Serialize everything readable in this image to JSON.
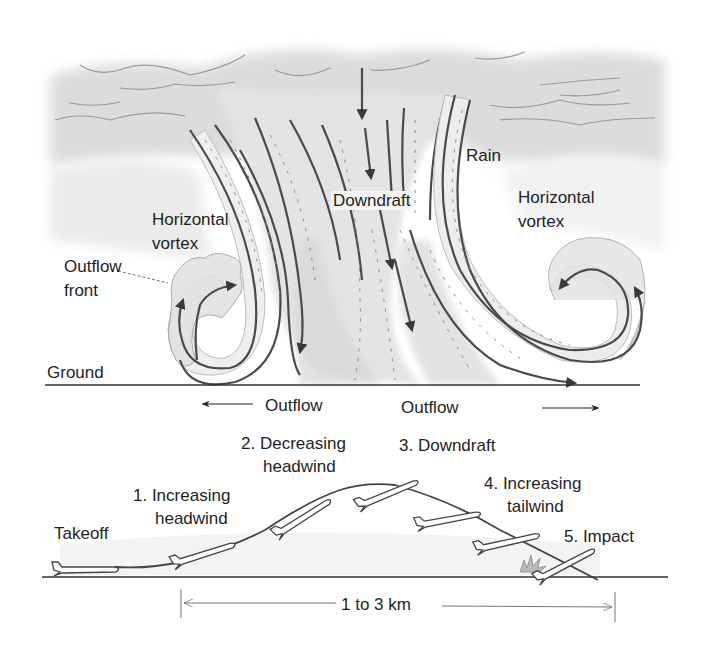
{
  "diagram": {
    "type": "microburst-wind-shear",
    "storm": {
      "labels": {
        "rain": "Rain",
        "downdraft": "Downdraft",
        "left_vortex": [
          "Horizontal",
          "vortex"
        ],
        "right_vortex": [
          "Horizontal",
          "vortex"
        ],
        "outflow_front": [
          "Outflow",
          "front"
        ],
        "ground": "Ground",
        "outflow_left": "Outflow",
        "outflow_right": "Outflow"
      }
    },
    "flight_path": {
      "stages": [
        {
          "id": 0,
          "label": [
            "Takeoff"
          ]
        },
        {
          "id": 1,
          "label": [
            "1. Increasing",
            "headwind"
          ]
        },
        {
          "id": 2,
          "label": [
            "2. Decreasing",
            "headwind"
          ]
        },
        {
          "id": 3,
          "label": [
            "3. Downdraft"
          ]
        },
        {
          "id": 4,
          "label": [
            "4. Increasing",
            "tailwind"
          ]
        },
        {
          "id": 5,
          "label": [
            "5. Impact"
          ]
        }
      ],
      "distance_label": "1 to 3 km"
    },
    "colors": {
      "line": "#444444",
      "arrow": "#3a3a3a",
      "cloud": "#d6d6d6",
      "shade": "#e4e4e4",
      "background": "#ffffff",
      "impact": "#b8b8b8"
    }
  }
}
